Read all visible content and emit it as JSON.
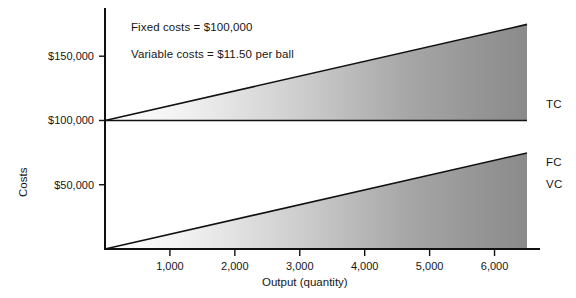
{
  "chart_data": {
    "type": "line",
    "title": "",
    "xlabel": "Output (quantity)",
    "ylabel": "Costs",
    "xlim": [
      0,
      6500
    ],
    "ylim": [
      0,
      187500
    ],
    "grid": false,
    "legend_position": "right-inline",
    "xticks": [
      1000,
      2000,
      3000,
      4000,
      5000,
      6000
    ],
    "xtick_labels": [
      "1,000",
      "2,000",
      "3,000",
      "4,000",
      "5,000",
      "6,000"
    ],
    "yticks": [
      50000,
      100000,
      150000
    ],
    "ytick_labels": [
      "$50,000",
      "$100,000",
      "$150,000"
    ],
    "annotations": [
      "Fixed costs = $100,000",
      "Variable costs = $11.50 per ball"
    ],
    "series": [
      {
        "name": "TC",
        "label": "TC",
        "x": [
          0,
          6500
        ],
        "values": [
          100000,
          174750
        ],
        "filled": true
      },
      {
        "name": "FC",
        "label": "FC",
        "x": [
          0,
          6500
        ],
        "values": [
          100000,
          100000
        ],
        "filled": false
      },
      {
        "name": "VC",
        "label": "VC",
        "x": [
          0,
          6500
        ],
        "values": [
          0,
          74750
        ],
        "filled": true
      }
    ],
    "parameters": {
      "fixed_costs": 100000,
      "variable_cost_per_unit": 11.5
    },
    "colors": {
      "line": "#111111",
      "axis": "#111111",
      "fill_light": "#ffffff",
      "fill_dark": "#8a8a8a",
      "background": "#ffffff",
      "text": "#161616"
    }
  }
}
